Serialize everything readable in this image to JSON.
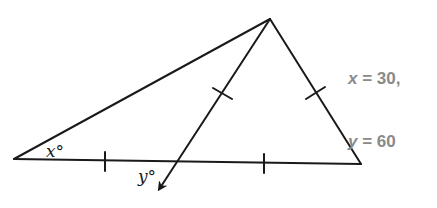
{
  "diagram": {
    "type": "geometry-triangle",
    "vertices": {
      "left": [
        14,
        159
      ],
      "apex": [
        270,
        19
      ],
      "right": [
        361,
        164
      ]
    },
    "ray": {
      "from": [
        270,
        19
      ],
      "to": [
        158,
        192
      ],
      "base_intersection": [
        175,
        161
      ]
    },
    "tick_marks": [
      {
        "segment": "left-to-intersection",
        "at": [
          105,
          161
        ]
      },
      {
        "segment": "intersection-to-right",
        "at": [
          264,
          163
        ]
      },
      {
        "segment": "apex-to-intersection",
        "at": [
          222,
          94
        ]
      },
      {
        "segment": "apex-to-right",
        "at": [
          315,
          93
        ]
      }
    ],
    "angle_labels": {
      "x": {
        "text": "x°",
        "at": [
          48,
          157
        ]
      },
      "y": {
        "text": "y°",
        "at": [
          140,
          182
        ]
      }
    },
    "stroke_color": "#1a1a1a"
  },
  "answer": {
    "x_var": "x",
    "x_eq": " = 30,",
    "y_var": "y",
    "y_eq": " = 60",
    "color": "#8a8a8a"
  }
}
